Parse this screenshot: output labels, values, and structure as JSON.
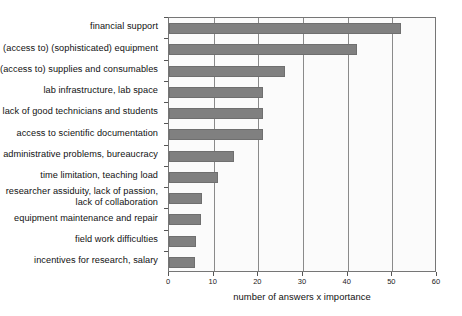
{
  "chart_data": {
    "type": "bar",
    "orientation": "horizontal",
    "title": "",
    "xlabel": "number of answers x importance",
    "ylabel": "",
    "xlim": [
      0,
      60
    ],
    "xticks": [
      0,
      10,
      20,
      30,
      40,
      50,
      60
    ],
    "grid": true,
    "legend": null,
    "categories": [
      "financial support",
      "(access to) (sophisticated) equipment",
      "(access to) supplies and consumables",
      "lab infrastructure, lab space",
      "lack of good technicians and students",
      "access to scientific documentation",
      "administrative problems, bureaucracy",
      "time limitation, teaching load",
      "researcher assiduity, lack of passion,\nlack of collaboration",
      "equipment maintenance and repair",
      "field work difficulties",
      "incentives for research, salary"
    ],
    "values": [
      52,
      42,
      26,
      21,
      21,
      21,
      14.5,
      11,
      7.4,
      7.2,
      6,
      5.8
    ],
    "bar_color": "#808080",
    "plot_background": "#fbfbfb",
    "frame_color": "#767676"
  }
}
